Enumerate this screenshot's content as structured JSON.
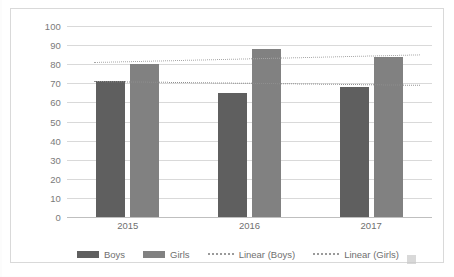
{
  "chart_data": {
    "type": "bar",
    "title": "",
    "xlabel": "",
    "ylabel": "",
    "categories": [
      "2015",
      "2016",
      "2017"
    ],
    "ylim": [
      0,
      100
    ],
    "yticks": [
      0,
      10,
      20,
      30,
      40,
      50,
      60,
      70,
      80,
      90,
      100
    ],
    "grid": true,
    "legend_position": "bottom",
    "series": [
      {
        "name": "Boys",
        "type": "bar",
        "color": "#5f5f5f",
        "values": [
          71,
          65,
          68
        ]
      },
      {
        "name": "Girls",
        "type": "bar",
        "color": "#818181",
        "values": [
          80,
          88,
          84
        ]
      },
      {
        "name": "Linear (Boys)",
        "type": "trendline",
        "style": "dotted",
        "color": "#8f8f8f",
        "endpoints": [
          71,
          69
        ]
      },
      {
        "name": "Linear (Girls)",
        "type": "trendline",
        "style": "dotted",
        "color": "#a6a6a6",
        "endpoints": [
          81,
          85
        ]
      }
    ]
  },
  "legend": {
    "items": [
      {
        "label": "Boys",
        "marker": "swatch-dark"
      },
      {
        "label": "Girls",
        "marker": "swatch-light"
      },
      {
        "label": "Linear (Boys)",
        "marker": "dotted-line"
      },
      {
        "label": "Linear (Girls)",
        "marker": "dotted-line"
      }
    ]
  }
}
